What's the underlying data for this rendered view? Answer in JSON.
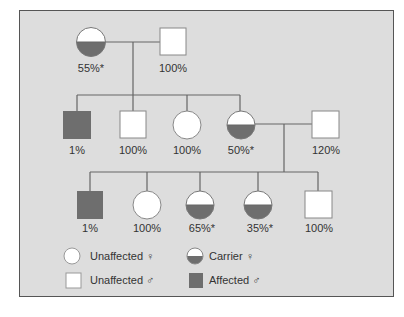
{
  "diagram": {
    "type": "pedigree",
    "colors": {
      "background": "#dddddd",
      "frame": "#555555",
      "line": "#666666",
      "affected": "#6e6e6e",
      "unaffected": "#ffffff",
      "text": "#333333"
    },
    "generation1": [
      {
        "id": "g1-mother",
        "sex": "female",
        "status": "carrier",
        "label": "55%*"
      },
      {
        "id": "g1-father",
        "sex": "male",
        "status": "unaffected",
        "label": "100%"
      }
    ],
    "generation2": [
      {
        "id": "g2-son-1",
        "sex": "male",
        "status": "affected",
        "label": "1%"
      },
      {
        "id": "g2-son-2",
        "sex": "male",
        "status": "unaffected",
        "label": "100%"
      },
      {
        "id": "g2-daughter-1",
        "sex": "female",
        "status": "unaffected",
        "label": "100%"
      },
      {
        "id": "g2-daughter-2",
        "sex": "female",
        "status": "carrier",
        "label": "50%*"
      },
      {
        "id": "g2-spouse",
        "sex": "male",
        "status": "unaffected",
        "label": "120%"
      }
    ],
    "generation3": [
      {
        "id": "g3-son-1",
        "sex": "male",
        "status": "affected",
        "label": "1%"
      },
      {
        "id": "g3-daughter-1",
        "sex": "female",
        "status": "unaffected",
        "label": "100%"
      },
      {
        "id": "g3-daughter-2",
        "sex": "female",
        "status": "carrier",
        "label": "65%*"
      },
      {
        "id": "g3-daughter-3",
        "sex": "female",
        "status": "carrier",
        "label": "35%*"
      },
      {
        "id": "g3-son-2",
        "sex": "male",
        "status": "unaffected",
        "label": "100%"
      }
    ],
    "legend": [
      {
        "symbol": "circle-open",
        "label": "Unaffected ♀"
      },
      {
        "symbol": "circle-half",
        "label": "Carrier ♀"
      },
      {
        "symbol": "square-open",
        "label": "Unaffected ♂"
      },
      {
        "symbol": "square-filled",
        "label": "Affected ♂"
      }
    ]
  }
}
